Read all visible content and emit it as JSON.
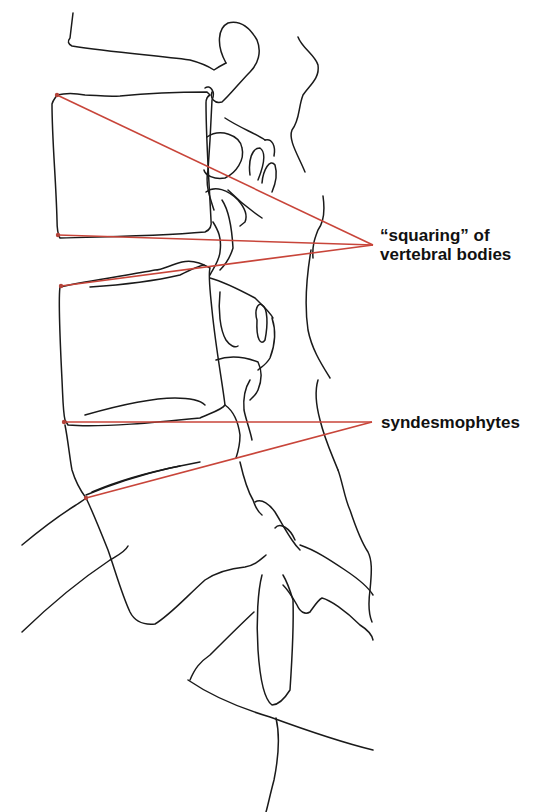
{
  "figure": {
    "type": "anatomical line drawing",
    "line_color": "#1a1a1a",
    "leader_color": "#c8453a",
    "background": "#ffffff"
  },
  "annotations": [
    {
      "id": "squaring",
      "line1": "“squaring” of",
      "line2": "vertebral bodies",
      "label_anchor": [
        373,
        245
      ],
      "targets": [
        [
          57,
          95
        ],
        [
          58,
          235
        ],
        [
          61,
          286
        ]
      ]
    },
    {
      "id": "syndesmophytes",
      "line1": "syndesmophytes",
      "label_anchor": [
        372,
        422
      ],
      "targets": [
        [
          64,
          422
        ],
        [
          86,
          498
        ]
      ]
    }
  ]
}
